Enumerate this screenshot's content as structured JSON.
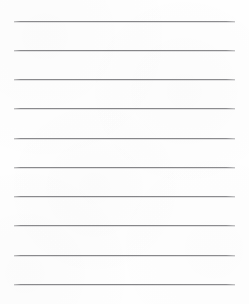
{
  "page": {
    "kind": "lined-notebook-paper",
    "width": 249,
    "height": 304,
    "background_color": "#fefefe",
    "text_content": ""
  },
  "ruling": {
    "line_color": "#858588",
    "line_thickness_px": 1,
    "line_count": 10,
    "left_margin_px": 14,
    "right_margin_px": 14,
    "line_length_px": 221,
    "first_line_y_px": 21,
    "line_spacing_px": 29.2,
    "last_line_y_px": 284,
    "lines": [
      {
        "index": 1,
        "y": 21,
        "x_start": 14,
        "x_end": 235
      },
      {
        "index": 2,
        "y": 50,
        "x_start": 14,
        "x_end": 235
      },
      {
        "index": 3,
        "y": 79,
        "x_start": 14,
        "x_end": 235
      },
      {
        "index": 4,
        "y": 108,
        "x_start": 14,
        "x_end": 235
      },
      {
        "index": 5,
        "y": 138,
        "x_start": 14,
        "x_end": 235
      },
      {
        "index": 6,
        "y": 167,
        "x_start": 14,
        "x_end": 235
      },
      {
        "index": 7,
        "y": 196,
        "x_start": 14,
        "x_end": 235
      },
      {
        "index": 8,
        "y": 225,
        "x_start": 14,
        "x_end": 235
      },
      {
        "index": 9,
        "y": 255,
        "x_start": 14,
        "x_end": 235
      },
      {
        "index": 10,
        "y": 284,
        "x_start": 14,
        "x_end": 235
      }
    ]
  }
}
